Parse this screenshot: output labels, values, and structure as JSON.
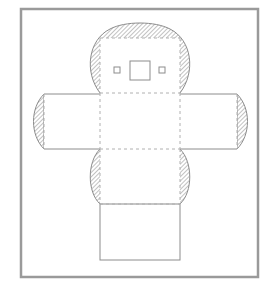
{
  "diagram": {
    "title": "",
    "colors": {
      "frame": "#9a9a9a",
      "outline": "#8c8c8c",
      "fold_line": "#b0b0b0",
      "hatch": "#a8a8a8",
      "background": "#ffffff"
    },
    "frame": {
      "x": 21,
      "y": 9,
      "width": 237,
      "height": 268
    },
    "faces": [
      {
        "id": "top-face",
        "x": 100,
        "y": 38,
        "width": 80,
        "height": 55
      },
      {
        "id": "center-face",
        "x": 100,
        "y": 93,
        "width": 80,
        "height": 56
      },
      {
        "id": "left-face",
        "x": 44,
        "y": 94,
        "width": 56,
        "height": 55
      },
      {
        "id": "right-face",
        "x": 180,
        "y": 94,
        "width": 57,
        "height": 55
      },
      {
        "id": "lower-face",
        "x": 100,
        "y": 149,
        "width": 80,
        "height": 55
      },
      {
        "id": "bottom-face",
        "x": 100,
        "y": 204,
        "width": 80,
        "height": 56
      }
    ],
    "windows": [
      {
        "id": "left-small-window",
        "x": 114,
        "y": 67,
        "width": 6,
        "height": 6
      },
      {
        "id": "center-window",
        "x": 130,
        "y": 61,
        "width": 20,
        "height": 19
      },
      {
        "id": "right-small-window",
        "x": 159,
        "y": 67,
        "width": 6,
        "height": 6
      }
    ],
    "fold_lines": [
      {
        "id": "fold-top-center",
        "x1": 100,
        "y1": 93,
        "x2": 180,
        "y2": 93
      },
      {
        "id": "fold-center-left",
        "x1": 100,
        "y1": 93,
        "x2": 100,
        "y2": 149
      },
      {
        "id": "fold-center-right",
        "x1": 180,
        "y1": 93,
        "x2": 180,
        "y2": 149
      },
      {
        "id": "fold-center-lower",
        "x1": 100,
        "y1": 149,
        "x2": 180,
        "y2": 149
      },
      {
        "id": "fold-lower-bottom",
        "x1": 100,
        "y1": 204,
        "x2": 180,
        "y2": 204
      },
      {
        "id": "fold-top-left",
        "x1": 100,
        "y1": 38,
        "x2": 100,
        "y2": 93
      },
      {
        "id": "fold-top-right",
        "x1": 180,
        "y1": 38,
        "x2": 180,
        "y2": 93
      },
      {
        "id": "fold-top-top",
        "x1": 100,
        "y1": 38,
        "x2": 180,
        "y2": 38
      },
      {
        "id": "fold-lower-left",
        "x1": 100,
        "y1": 149,
        "x2": 100,
        "y2": 204
      },
      {
        "id": "fold-lower-right",
        "x1": 180,
        "y1": 149,
        "x2": 180,
        "y2": 204
      },
      {
        "id": "fold-left-edge",
        "x1": 44,
        "y1": 94,
        "x2": 44,
        "y2": 149
      },
      {
        "id": "fold-right-edge",
        "x1": 237,
        "y1": 94,
        "x2": 237,
        "y2": 149
      }
    ]
  }
}
